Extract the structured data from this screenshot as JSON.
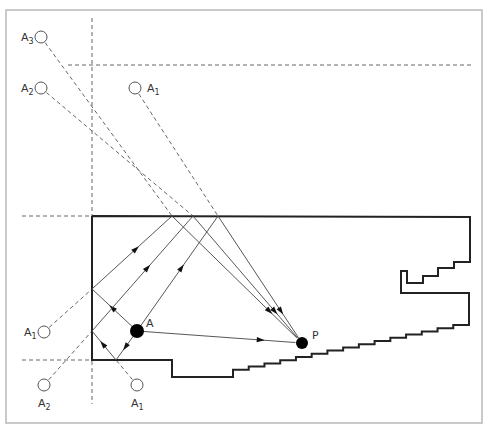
{
  "diagram": {
    "frame": {
      "x": 6,
      "y": 10,
      "w": 476,
      "h": 413
    },
    "guides": [
      {
        "x1": 92,
        "y1": 18,
        "x2": 92,
        "y2": 404
      },
      {
        "x1": 68,
        "y1": 65,
        "x2": 472,
        "y2": 65
      },
      {
        "x1": 22,
        "y1": 216,
        "x2": 92,
        "y2": 216
      },
      {
        "x1": 22,
        "y1": 360,
        "x2": 92,
        "y2": 360
      }
    ],
    "room_outline": [
      [
        92,
        216
      ],
      [
        470,
        217
      ],
      [
        470,
        262
      ],
      [
        454,
        262
      ],
      [
        454,
        268
      ],
      [
        438,
        268
      ],
      [
        438,
        276
      ],
      [
        423,
        276
      ],
      [
        423,
        283
      ],
      [
        407,
        283
      ],
      [
        407,
        271
      ],
      [
        401,
        271
      ],
      [
        401,
        293
      ],
      [
        469,
        293
      ],
      [
        469,
        325
      ]
    ],
    "stairs": {
      "start": [
        469,
        325
      ],
      "end": [
        233,
        373
      ],
      "count": 15
    },
    "room_tail": [
      [
        233,
        377
      ],
      [
        172,
        377
      ],
      [
        172,
        360
      ],
      [
        92,
        360
      ],
      [
        92,
        216
      ]
    ],
    "source": {
      "label": "A",
      "x": 137,
      "y": 331,
      "r": 7
    },
    "receiver": {
      "label": "P",
      "x": 302,
      "y": 343,
      "r": 6
    },
    "image_sources": [
      {
        "label": "A",
        "sub": "3",
        "x": 41,
        "y": 37,
        "label_side": "left"
      },
      {
        "label": "A",
        "sub": "2",
        "x": 41,
        "y": 88,
        "label_side": "left"
      },
      {
        "label": "A",
        "sub": "1",
        "x": 135,
        "y": 88,
        "label_side": "right"
      },
      {
        "label": "A",
        "sub": "1",
        "x": 44,
        "y": 332,
        "label_side": "left"
      },
      {
        "label": "A",
        "sub": "2",
        "x": 44,
        "y": 385,
        "label_side": "below"
      },
      {
        "label": "A",
        "sub": "1",
        "x": 137,
        "y": 385,
        "label_side": "below"
      }
    ],
    "image_lines": [
      {
        "from": [
          41,
          37
        ],
        "to": [
          172,
          216
        ]
      },
      {
        "from": [
          41,
          88
        ],
        "to": [
          193,
          216
        ]
      },
      {
        "from": [
          135,
          88
        ],
        "to": [
          218,
          216
        ]
      },
      {
        "from": [
          44,
          332
        ],
        "to": [
          92,
          289
        ]
      },
      {
        "from": [
          44,
          385
        ],
        "to": [
          92,
          331
        ]
      },
      {
        "from": [
          137,
          385
        ],
        "to": [
          116,
          360
        ]
      }
    ],
    "rays": [
      {
        "name": "direct",
        "points": [
          [
            137,
            331
          ],
          [
            302,
            343
          ]
        ]
      },
      {
        "name": "path-A3",
        "points": [
          [
            137,
            331
          ],
          [
            92,
            289
          ],
          [
            172,
            216
          ],
          [
            302,
            343
          ]
        ]
      },
      {
        "name": "path-A2",
        "points": [
          [
            137,
            331
          ],
          [
            116,
            360
          ],
          [
            92,
            331
          ],
          [
            193,
            216
          ],
          [
            302,
            343
          ]
        ]
      },
      {
        "name": "path-A1",
        "points": [
          [
            137,
            331
          ],
          [
            218,
            216
          ],
          [
            302,
            343
          ]
        ]
      }
    ]
  }
}
